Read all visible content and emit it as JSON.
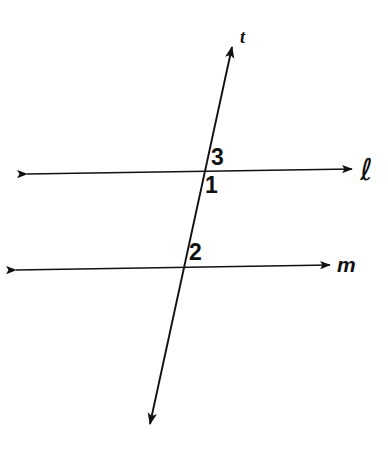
{
  "figure": {
    "background_color": "#ffffff",
    "stroke_color": "#111111",
    "width": 388,
    "height": 449,
    "lines": [
      {
        "id": "line-l",
        "label": "ℓ",
        "label_name": "line-label-l",
        "kind": "horizontal",
        "arrows": "both",
        "x1": 27,
        "y1": 174,
        "x2": 352,
        "y2": 169,
        "label_x": 360,
        "label_y": 155
      },
      {
        "id": "line-m",
        "label": "m",
        "label_name": "line-label-m",
        "kind": "horizontal",
        "arrows": "both",
        "x1": 16,
        "y1": 270,
        "x2": 330,
        "y2": 265,
        "label_x": 337,
        "label_y": 254
      },
      {
        "id": "line-t",
        "label": "t",
        "label_name": "line-label-t",
        "kind": "transversal",
        "arrows": "both",
        "x1": 232,
        "y1": 47,
        "x2": 150,
        "y2": 424,
        "label_x": 240,
        "label_y": 28
      }
    ],
    "intersections": [
      {
        "id": "intersection-t-l",
        "x": 201,
        "y": 172
      },
      {
        "id": "intersection-t-m",
        "x": 181,
        "y": 268
      }
    ],
    "angle_labels": [
      {
        "id": "angle-3",
        "text": "3",
        "x": 211,
        "y": 146,
        "position": "above-right-of-l-intersection"
      },
      {
        "id": "angle-1",
        "text": "1",
        "x": 205,
        "y": 174,
        "position": "below-right-of-l-intersection"
      },
      {
        "id": "angle-2",
        "text": "2",
        "x": 189,
        "y": 241,
        "position": "above-right-of-m-intersection"
      }
    ]
  }
}
